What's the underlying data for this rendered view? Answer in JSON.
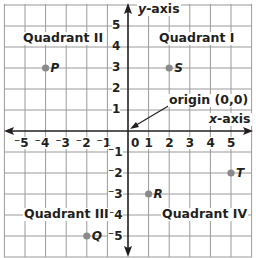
{
  "diagram": {
    "colors": {
      "grid": "#9a9a9a",
      "axis": "#231f20",
      "point": "#8a8a8a",
      "text": "#231f20"
    },
    "axes": {
      "x_label_var": "x",
      "x_label_suffix": "-axis",
      "y_label_var": "y",
      "y_label_suffix": "-axis",
      "origin_label": "origin (0,0)"
    },
    "x_ticks": [
      "⁻5",
      "⁻4",
      "⁻3",
      "⁻2",
      "⁻1",
      "0",
      "1",
      "2",
      "3",
      "4",
      "5"
    ],
    "y_ticks_positive": [
      "5",
      "4",
      "3",
      "2",
      "1"
    ],
    "y_ticks_negative": [
      "⁻1",
      "⁻2",
      "⁻3",
      "⁻4",
      "⁻5"
    ],
    "quadrants": {
      "q1": "Quadrant I",
      "q2": "Quadrant II",
      "q3": "Quadrant III",
      "q4": "Quadrant IV"
    },
    "points": [
      {
        "name": "P",
        "x": -4,
        "y": 3
      },
      {
        "name": "S",
        "x": 2,
        "y": 3
      },
      {
        "name": "R",
        "x": 1,
        "y": -3
      },
      {
        "name": "T",
        "x": 5,
        "y": -2
      },
      {
        "name": "Q",
        "x": -2,
        "y": -5
      }
    ]
  }
}
